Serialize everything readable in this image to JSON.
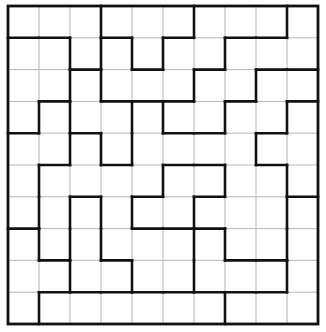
{
  "puzzle": {
    "type": "region-division-grid",
    "rows": 10,
    "cols": 10,
    "origin": {
      "x": 8,
      "y": 6
    },
    "cell_width": 31,
    "cell_height": 31.8,
    "colors": {
      "background": "#ffffff",
      "thin_line": "#b5b5b5",
      "thick_line": "#111111"
    },
    "thick_vertical": {
      "description": "For each row r, list of interior vertical grid-line indices k (1-9) that are thick (between col k-1 and col k)",
      "rows": [
        [
          3,
          6,
          9
        ],
        [
          2,
          3,
          4,
          5,
          7
        ],
        [
          2,
          3,
          6,
          8
        ],
        [
          1,
          2,
          4,
          5,
          7,
          9
        ],
        [
          2,
          3,
          4,
          8
        ],
        [
          1,
          5,
          7,
          9
        ],
        [
          1,
          2,
          3,
          4,
          6,
          9
        ],
        [
          1,
          2,
          3,
          6,
          7,
          9
        ],
        [
          2,
          4,
          6,
          9
        ],
        [
          1,
          7
        ]
      ]
    },
    "thick_horizontal": {
      "description": "For each interior horizontal grid-line k (1-9), list of column indices c (0-9) whose segment is thick (between row k-1 and row k)",
      "lines": [
        [
          0,
          1,
          3,
          5,
          7,
          8
        ],
        [
          2,
          4,
          6,
          8,
          9
        ],
        [
          1,
          3,
          4,
          5,
          7,
          9
        ],
        [
          0,
          2,
          5,
          6,
          8
        ],
        [
          1,
          3,
          5,
          6,
          8
        ],
        [
          2,
          4,
          6,
          9
        ],
        [
          0,
          4,
          5,
          6
        ],
        [
          1,
          3,
          7,
          8
        ],
        [
          1,
          2,
          3,
          4,
          5,
          6,
          7,
          8
        ]
      ]
    }
  }
}
